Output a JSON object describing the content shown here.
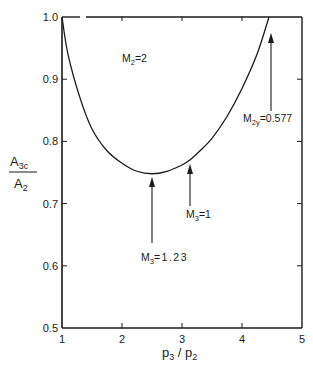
{
  "chart_data": {
    "type": "line",
    "title": "",
    "xlabel": "p3 / p2",
    "ylabel": "A3c / A2",
    "xlim": [
      1,
      5
    ],
    "ylim": [
      0.5,
      1.0
    ],
    "x_ticks": [
      1,
      2,
      3,
      4,
      5
    ],
    "y_ticks": [
      0.5,
      0.6,
      0.7,
      0.8,
      0.9,
      1.0
    ],
    "x_tick_labels": [
      "1",
      "2",
      "3",
      "4",
      "5"
    ],
    "y_tick_labels": [
      "0.5",
      "0.6",
      "0.7",
      "0.8",
      "0.9",
      "1.0"
    ],
    "grid": false,
    "legend": null,
    "series": [
      {
        "name": "M2 = 2",
        "x": [
          1.0,
          1.1,
          1.3,
          1.5,
          1.75,
          2.0,
          2.25,
          2.5,
          2.75,
          3.0,
          3.13,
          3.3,
          3.5,
          3.75,
          4.0,
          4.25,
          4.45
        ],
        "y": [
          1.0,
          0.94,
          0.87,
          0.82,
          0.785,
          0.765,
          0.752,
          0.748,
          0.752,
          0.762,
          0.77,
          0.785,
          0.805,
          0.84,
          0.885,
          0.94,
          1.0
        ]
      }
    ],
    "annotations": [
      {
        "text": "M2=2",
        "x": 2.1,
        "y": 0.91,
        "type": "label"
      },
      {
        "text": "M3=1.23",
        "x": 2.5,
        "y": 0.748,
        "type": "arrow",
        "note": "minimum of curve"
      },
      {
        "text": "M3=1",
        "x": 3.13,
        "y": 0.77,
        "type": "arrow"
      },
      {
        "text": "M2y=0.577",
        "x": 4.48,
        "y": 0.985,
        "type": "arrow",
        "note": "curve end at A3c/A2 = 1"
      }
    ]
  },
  "labels": {
    "y_axis": {
      "main": "A",
      "sub": "3c",
      "den_main": "A",
      "den_sub": "2"
    },
    "x_axis": {
      "p3": "p",
      "p3_sub": "3",
      "slash": " / ",
      "p2": "p",
      "p2_sub": "2"
    },
    "m2": {
      "main": "M",
      "sub": "2",
      "rest": "=2"
    },
    "m3_min": {
      "main": "M",
      "sub": "3",
      "rest": "=1.23"
    },
    "m3_one": {
      "main": "M",
      "sub": "3",
      "rest": "=1"
    },
    "m2y": {
      "main": "M",
      "sub": "2y",
      "rest": "=0.577"
    }
  }
}
